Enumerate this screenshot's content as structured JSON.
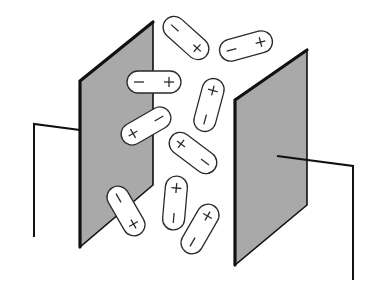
{
  "diagram": {
    "colors": {
      "plate_fill": "#a9a9a9",
      "outline": "#111111",
      "capsule_fill": "#ffffff",
      "background": "#ffffff"
    },
    "left_plate": {
      "points": "80,81 153,22 153,185 80,247",
      "wire": "80,130 34,124 34,237"
    },
    "right_plate": {
      "points": "235,100 307,50 307,205 235,265",
      "wire": "277,156 353,166 353,280"
    },
    "dipoles": [
      {
        "id": "dipole-1",
        "cx": 186,
        "cy": 38,
        "angle": 42,
        "length": 54,
        "width": 22,
        "first": "−",
        "second": "+"
      },
      {
        "id": "dipole-2",
        "cx": 246,
        "cy": 46,
        "angle": -15,
        "length": 54,
        "width": 22,
        "first": "−",
        "second": "+"
      },
      {
        "id": "dipole-3",
        "cx": 154,
        "cy": 82,
        "angle": 0,
        "length": 54,
        "width": 22,
        "first": "−",
        "second": "+"
      },
      {
        "id": "dipole-4",
        "cx": 209,
        "cy": 105,
        "angle": 105,
        "length": 54,
        "width": 22,
        "first": "+",
        "second": "−"
      },
      {
        "id": "dipole-5",
        "cx": 146,
        "cy": 126,
        "angle": -30,
        "length": 54,
        "width": 22,
        "first": "+",
        "second": "−"
      },
      {
        "id": "dipole-6",
        "cx": 193,
        "cy": 153,
        "angle": 37,
        "length": 54,
        "width": 22,
        "first": "+",
        "second": "−"
      },
      {
        "id": "dipole-7",
        "cx": 126,
        "cy": 211,
        "angle": 60,
        "length": 54,
        "width": 22,
        "first": "−",
        "second": "+"
      },
      {
        "id": "dipole-8",
        "cx": 175,
        "cy": 203,
        "angle": 95,
        "length": 54,
        "width": 22,
        "first": "+",
        "second": "−"
      },
      {
        "id": "dipole-9",
        "cx": 200,
        "cy": 229,
        "angle": -60,
        "length": 54,
        "width": 22,
        "first": "−",
        "second": "+"
      }
    ]
  }
}
